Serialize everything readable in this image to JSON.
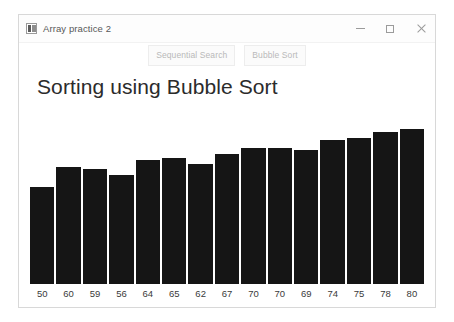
{
  "window": {
    "title": "Array practice 2",
    "icon": "app-icon",
    "controls": {
      "minimize": "minimize-icon",
      "maximize": "maximize-icon",
      "close": "close-icon"
    }
  },
  "toolbar": {
    "buttons": [
      {
        "label": "Sequential Search"
      },
      {
        "label": "Bubble Sort"
      }
    ]
  },
  "main": {
    "heading": "Sorting using Bubble Sort"
  },
  "colors": {
    "bar": "#151515",
    "heading_text": "#2b2b2b",
    "label_text": "#3a3a3a",
    "window_border": "#d8d8d8",
    "button_text": "#b9b9b9"
  },
  "chart_data": {
    "type": "bar",
    "title": "Sorting using Bubble Sort",
    "xlabel": "",
    "ylabel": "",
    "grid": false,
    "legend": null,
    "ylim": [
      0,
      88
    ],
    "categories": [
      "50",
      "60",
      "59",
      "56",
      "64",
      "65",
      "62",
      "67",
      "70",
      "70",
      "69",
      "74",
      "75",
      "78",
      "80"
    ],
    "values": [
      50,
      60,
      59,
      56,
      64,
      65,
      62,
      67,
      70,
      70,
      69,
      74,
      75,
      78,
      80
    ],
    "labels": [
      "50",
      "60",
      "59",
      "56",
      "64",
      "65",
      "62",
      "67",
      "70",
      "70",
      "69",
      "74",
      "75",
      "78",
      "80"
    ]
  }
}
